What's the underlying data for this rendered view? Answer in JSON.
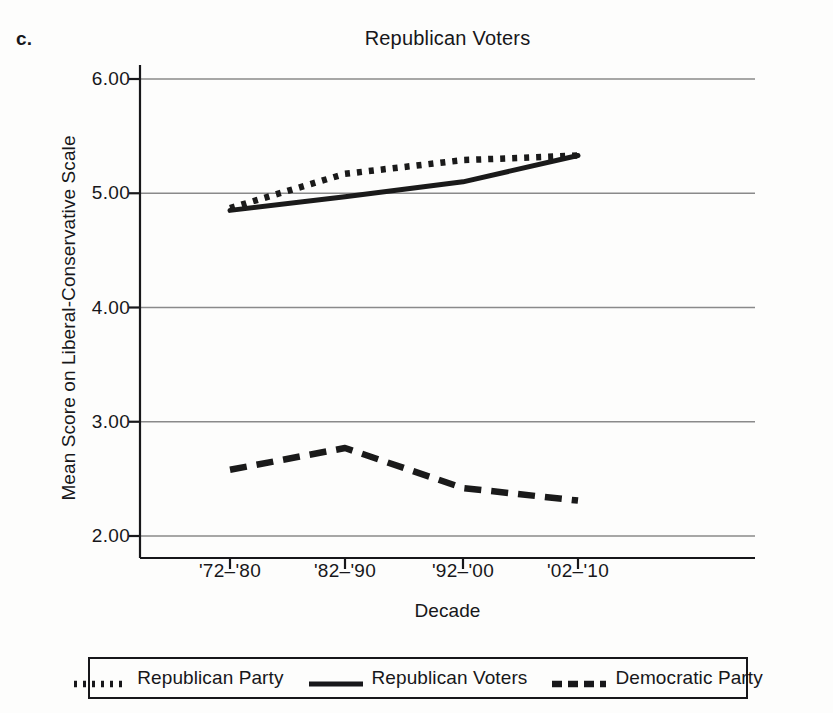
{
  "panel": {
    "label": "c."
  },
  "chart_data": {
    "type": "line",
    "title": "Republican Voters",
    "xlabel": "Decade",
    "ylabel": "Mean Score on Liberal-Conservative Scale",
    "categories": [
      "'72–'80",
      "'82–'90",
      "'92–'00",
      "'02–'10"
    ],
    "ylim": [
      2.0,
      6.0
    ],
    "yticks": [
      "2.00",
      "3.00",
      "4.00",
      "5.00",
      "6.00"
    ],
    "ytick_values": [
      2.0,
      3.0,
      4.0,
      5.0,
      6.0
    ],
    "grid": true,
    "legend_position": "bottom",
    "series": [
      {
        "name": "Republican Party",
        "style": "dotted",
        "color": "#1a1a1a",
        "values": [
          4.87,
          5.17,
          5.29,
          5.33
        ]
      },
      {
        "name": "Republican Voters",
        "style": "solid",
        "color": "#1a1a1a",
        "values": [
          4.85,
          4.97,
          5.1,
          5.33
        ]
      },
      {
        "name": "Democratic Party",
        "style": "dashed",
        "color": "#1a1a1a",
        "values": [
          2.58,
          2.77,
          2.42,
          2.31
        ]
      }
    ]
  },
  "legend": {
    "items": [
      {
        "label": "Republican Party",
        "style": "dotted"
      },
      {
        "label": "Republican Voters",
        "style": "solid"
      },
      {
        "label": "Democratic Party",
        "style": "dashed"
      }
    ]
  },
  "colors": {
    "ink": "#17171a",
    "grid": "#8a8a8a",
    "background": "#fdfdfc"
  }
}
